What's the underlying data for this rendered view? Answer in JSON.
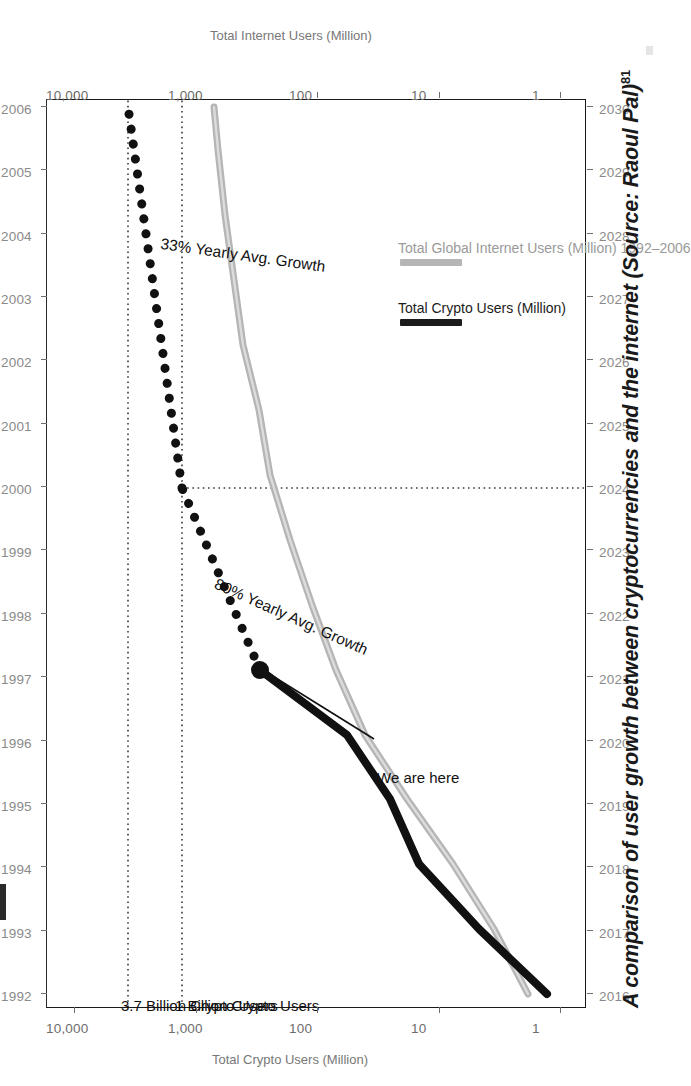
{
  "caption": {
    "text": "A comparison of user growth between cryptocurrencies and the internet (Source: Raoul Pal)",
    "footnote": "81"
  },
  "axes": {
    "left_title": "Total Crypto Users (Million)",
    "right_title": "Total Internet Users (Million)",
    "left_ticks": [
      "10,000",
      "1,000",
      "100",
      "10",
      "1"
    ],
    "right_ticks": [
      "10,000",
      "1,000",
      "100",
      "10",
      "1"
    ],
    "top_years": [
      "1992",
      "1993",
      "1994",
      "1995",
      "1996",
      "1997",
      "1998",
      "1999",
      "2000",
      "2001",
      "2002",
      "2003",
      "2004",
      "2005",
      "2006"
    ],
    "bottom_years": [
      "2016",
      "2017",
      "2018",
      "2019",
      "2020",
      "2021",
      "2022",
      "2023",
      "2024",
      "2025",
      "2026",
      "2027",
      "2028",
      "2029",
      "2030"
    ]
  },
  "annotations": {
    "threshold_37b": "3.7 Billion Crypto Users",
    "threshold_1b": "1 Billion Crypto Users",
    "we_are_here": "We are here",
    "growth_33": "33% Yearly Avg. Growth",
    "growth_80": "80% Yearly Avg. Growth"
  },
  "legend": {
    "items": [
      {
        "label": "Total Crypto Users (Million)",
        "color": "#1b1b1b",
        "style": "solid-thick"
      },
      {
        "label": "Total Global Internet Users (Million) 1992–2006",
        "color": "#b3b3b3",
        "style": "solid-gray"
      }
    ]
  },
  "colors": {
    "crypto_line": "#111111",
    "internet_line": "#b5b5b5",
    "axis": "#1a1a1a",
    "tick_label": "#8a8a8a",
    "guide": "#3a3a3a"
  },
  "chart_data": {
    "type": "line",
    "title": "",
    "xlabel": "",
    "ylabel": "Total Crypto Users (Million)",
    "y2label": "Total Internet Users (Million)",
    "yscale": "log",
    "ylim": [
      1,
      10000
    ],
    "y_ticks": [
      1,
      10,
      100,
      1000,
      10000
    ],
    "grid": false,
    "legend_position": "bottom-right",
    "x_bottom": [
      "2016",
      "2017",
      "2018",
      "2019",
      "2020",
      "2021",
      "2022",
      "2023",
      "2024",
      "2025",
      "2026",
      "2027",
      "2028",
      "2029",
      "2030"
    ],
    "x_top": [
      "1992",
      "1993",
      "1994",
      "1995",
      "1996",
      "1997",
      "1998",
      "1999",
      "2000",
      "2001",
      "2002",
      "2003",
      "2004",
      "2005",
      "2006"
    ],
    "series": [
      {
        "name": "Total Crypto Users (Million)",
        "axis": "left",
        "x_axis": "bottom",
        "style": "solid-thick-black",
        "x": [
          "2016",
          "2017",
          "2018",
          "2019",
          "2020",
          "2021.3"
        ],
        "values": [
          5,
          16,
          45,
          70,
          135,
          300
        ]
      },
      {
        "name": "Total Global Internet Users (Million) 1992-2006",
        "axis": "right",
        "x_axis": "top",
        "style": "solid-gray",
        "x": [
          "1992",
          "1993",
          "1994",
          "1995",
          "1996",
          "1997",
          "1998",
          "1999",
          "2000",
          "2001",
          "2002",
          "2003",
          "2004",
          "2005",
          "2006"
        ],
        "values": [
          4.5,
          8,
          16,
          36,
          74,
          120,
          188,
          281,
          414,
          502,
          665,
          781,
          913,
          1024,
          1093
        ]
      },
      {
        "name": "Projected Crypto Users (80% yearly growth)",
        "axis": "left",
        "x_axis": "bottom",
        "style": "dotted-black",
        "x": [
          "2021.3",
          "2024"
        ],
        "values": [
          300,
          1000
        ]
      },
      {
        "name": "Projected Crypto Users (33% yearly growth)",
        "axis": "left",
        "x_axis": "bottom",
        "style": "dotted-black",
        "x": [
          "2024",
          "2030"
        ],
        "values": [
          1000,
          3700
        ]
      }
    ],
    "reference_lines": [
      {
        "label": "3.7 Billion Crypto Users",
        "value": 3700,
        "style": "dotted"
      },
      {
        "label": "1 Billion Crypto Users",
        "value": 1000,
        "style": "dotted"
      }
    ],
    "point_annotations": [
      {
        "label": "We are here",
        "x": "2021.3",
        "y": 300
      }
    ],
    "growth_annotations": [
      {
        "label": "80% Yearly Avg. Growth",
        "segment": "2021-2024"
      },
      {
        "label": "33% Yearly Avg. Growth",
        "segment": "2024-2030"
      }
    ]
  }
}
